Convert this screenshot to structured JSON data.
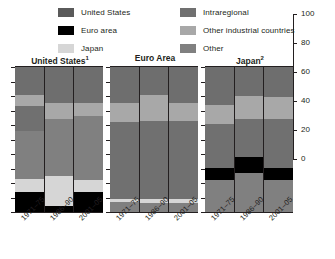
{
  "legend": {
    "columns": [
      {
        "items": [
          {
            "label": "United States",
            "color": "#5a5a5a",
            "swatch": "legend-swatch-united-states"
          },
          {
            "label": "Euro area",
            "color": "#000000",
            "swatch": "legend-swatch-euro-area"
          },
          {
            "label": "Japan",
            "color": "#d6d6d6",
            "swatch": "legend-swatch-japan"
          }
        ]
      },
      {
        "items": [
          {
            "label": "Intraregional",
            "color": "#707070",
            "swatch": "legend-swatch-intraregional"
          },
          {
            "label": "Other industrial countries",
            "color": "#a8a8a8",
            "swatch": "legend-swatch-other-industrial-countries"
          },
          {
            "label": "Other",
            "color": "#808080",
            "swatch": "legend-swatch-other"
          }
        ]
      }
    ]
  },
  "axis": {
    "ticks": [
      0,
      20,
      40,
      60,
      80,
      100
    ],
    "min": 0,
    "max": 100,
    "position": "right"
  },
  "chart_data": {
    "type": "bar",
    "subtype": "stacked-percent",
    "title": "",
    "xlabel": "",
    "ylabel": "",
    "ylim": [
      0,
      100
    ],
    "grid": false,
    "legend_position": "top",
    "categories": [
      "1971–75",
      "1986–90",
      "2001–05"
    ],
    "series": [
      {
        "name": "United States",
        "color": "#5a5a5a"
      },
      {
        "name": "Euro area",
        "color": "#000000"
      },
      {
        "name": "Japan",
        "color": "#d6d6d6"
      },
      {
        "name": "Intraregional",
        "color": "#707070"
      },
      {
        "name": "Other industrial countries",
        "color": "#a8a8a8"
      },
      {
        "name": "Other",
        "color": "#808080"
      }
    ],
    "panels": [
      {
        "title": "United States",
        "footnote": "1",
        "bars": [
          {
            "category": "1971–75",
            "segments": [
              {
                "name": "Euro area",
                "color": "#000000",
                "value": 14
              },
              {
                "name": "Japan",
                "color": "#d6d6d6",
                "value": 9
              },
              {
                "name": "Other",
                "color": "#808080",
                "value": 33
              },
              {
                "name": "Intraregional",
                "color": "#707070",
                "value": 17
              },
              {
                "name": "Other industrial countries",
                "color": "#a8a8a8",
                "value": 8
              },
              {
                "name": "Intraregional 2",
                "color": "#6e6e6e",
                "value": 19
              }
            ]
          },
          {
            "category": "1986–90",
            "segments": [
              {
                "name": "Euro area",
                "color": "#000000",
                "value": 4
              },
              {
                "name": "Japan",
                "color": "#d6d6d6",
                "value": 21
              },
              {
                "name": "Other",
                "color": "#808080",
                "value": 39
              },
              {
                "name": "Other industrial countries",
                "color": "#a8a8a8",
                "value": 11
              },
              {
                "name": "Intraregional",
                "color": "#6e6e6e",
                "value": 25
              }
            ]
          },
          {
            "category": "2001–05",
            "segments": [
              {
                "name": "Euro area",
                "color": "#000000",
                "value": 14
              },
              {
                "name": "Japan",
                "color": "#d6d6d6",
                "value": 8
              },
              {
                "name": "Other",
                "color": "#808080",
                "value": 44
              },
              {
                "name": "Other industrial countries",
                "color": "#a8a8a8",
                "value": 9
              },
              {
                "name": "Intraregional",
                "color": "#6e6e6e",
                "value": 25
              }
            ]
          }
        ]
      },
      {
        "title": "Euro Area",
        "footnote": "",
        "bars": [
          {
            "category": "1971–75",
            "segments": [
              {
                "name": "Other",
                "color": "#808080",
                "value": 7
              },
              {
                "name": "Japan",
                "color": "#d6d6d6",
                "value": 2
              },
              {
                "name": "Intraregional",
                "color": "#707070",
                "value": 53
              },
              {
                "name": "Other industrial countries",
                "color": "#a8a8a8",
                "value": 13
              },
              {
                "name": "United States",
                "color": "#6e6e6e",
                "value": 25
              }
            ]
          },
          {
            "category": "1986–90",
            "segments": [
              {
                "name": "Other",
                "color": "#808080",
                "value": 6
              },
              {
                "name": "Japan",
                "color": "#d6d6d6",
                "value": 3
              },
              {
                "name": "Intraregional",
                "color": "#707070",
                "value": 54
              },
              {
                "name": "Other industrial countries",
                "color": "#a8a8a8",
                "value": 18
              },
              {
                "name": "United States",
                "color": "#6e6e6e",
                "value": 19
              }
            ]
          },
          {
            "category": "2001–05",
            "segments": [
              {
                "name": "Other",
                "color": "#808080",
                "value": 6
              },
              {
                "name": "Japan",
                "color": "#d6d6d6",
                "value": 3
              },
              {
                "name": "Intraregional",
                "color": "#707070",
                "value": 54
              },
              {
                "name": "Other industrial countries",
                "color": "#a8a8a8",
                "value": 12
              },
              {
                "name": "United States",
                "color": "#6e6e6e",
                "value": 25
              }
            ]
          }
        ]
      },
      {
        "title": "Japan",
        "footnote": "2",
        "bars": [
          {
            "category": "1971–75",
            "segments": [
              {
                "name": "Other",
                "color": "#808080",
                "value": 22
              },
              {
                "name": "Euro area",
                "color": "#000000",
                "value": 8
              },
              {
                "name": "Intraregional",
                "color": "#707070",
                "value": 31
              },
              {
                "name": "Other industrial countries",
                "color": "#a8a8a8",
                "value": 13
              },
              {
                "name": "United States",
                "color": "#6e6e6e",
                "value": 26
              }
            ]
          },
          {
            "category": "1986–90",
            "segments": [
              {
                "name": "Other",
                "color": "#808080",
                "value": 27
              },
              {
                "name": "Euro area",
                "color": "#000000",
                "value": 11
              },
              {
                "name": "Intraregional",
                "color": "#707070",
                "value": 26
              },
              {
                "name": "Other industrial countries",
                "color": "#a8a8a8",
                "value": 16
              },
              {
                "name": "United States",
                "color": "#6e6e6e",
                "value": 20
              }
            ]
          },
          {
            "category": "2001–05",
            "segments": [
              {
                "name": "Other",
                "color": "#808080",
                "value": 22
              },
              {
                "name": "Euro area",
                "color": "#000000",
                "value": 8
              },
              {
                "name": "Intraregional",
                "color": "#707070",
                "value": 34
              },
              {
                "name": "Other industrial countries",
                "color": "#a8a8a8",
                "value": 15
              },
              {
                "name": "United States",
                "color": "#6e6e6e",
                "value": 21
              }
            ]
          }
        ]
      }
    ]
  }
}
